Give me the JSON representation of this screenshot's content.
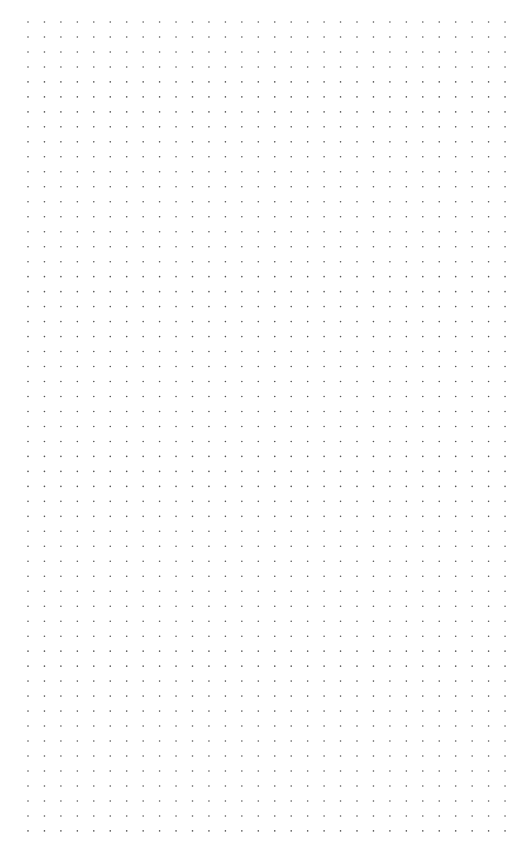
{
  "page": {
    "background": "#ffffff",
    "type": "dot-grid-paper"
  },
  "grid": {
    "columns": 30,
    "rows": 55,
    "origin_x": 28,
    "origin_y": 22,
    "spacing_x": 16.45,
    "spacing_y": 14.98,
    "dot_radius": 0.8,
    "dot_color": "#555555"
  }
}
